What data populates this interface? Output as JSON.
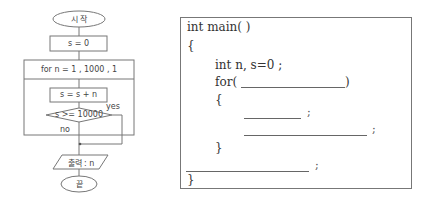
{
  "flowchart": {
    "start_label": "시 작",
    "init_label": "s = 0",
    "loop_label": "for  n = 1 , 1000 , 1",
    "body_label": "s = s + n",
    "condition_label": "s >= 10000",
    "yes_label": "yes",
    "no_label": "no",
    "output_label": "출력 : n",
    "end_label": "끝"
  },
  "code": {
    "lines": [
      "int main( )",
      "{",
      "int n, s=0 ;",
      "for(",
      ")",
      "{",
      ";",
      ";",
      "}",
      ";",
      "}"
    ]
  }
}
